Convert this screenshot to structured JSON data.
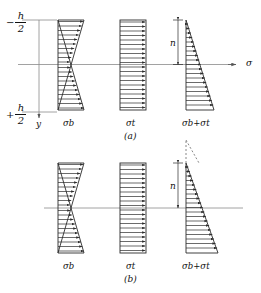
{
  "figure": {
    "title_caption_a": "(a)",
    "title_caption_b": "(b)",
    "axis": {
      "sigma_label": "σ",
      "y_label": "y",
      "top_ordinate_sign": "−",
      "top_ordinate_num": "h",
      "top_ordinate_den": "2",
      "bottom_ordinate_sign": "+",
      "bottom_ordinate_num": "h",
      "bottom_ordinate_den": "2"
    },
    "dimension": {
      "n_label": "n"
    },
    "panels": [
      {
        "id": "a",
        "caption": "(a)",
        "distributions": [
          {
            "name": "bending",
            "label_main": "σ",
            "label_sub": "b",
            "type": "antisymmetric-linear"
          },
          {
            "name": "axial",
            "label_main": "σ",
            "label_sub": "t",
            "type": "uniform"
          },
          {
            "name": "combined",
            "label_main": "σ",
            "label_sub": "b",
            "label_plus": "+",
            "label_main2": "σ",
            "label_sub2": "t",
            "type": "triangular"
          }
        ]
      },
      {
        "id": "b",
        "caption": "(b)",
        "distributions": [
          {
            "name": "bending",
            "label_main": "σ",
            "label_sub": "b",
            "type": "antisymmetric-linear"
          },
          {
            "name": "axial",
            "label_main": "σ",
            "label_sub": "t",
            "type": "uniform"
          },
          {
            "name": "combined",
            "label_main": "σ",
            "label_sub": "b",
            "label_plus": "+",
            "label_main2": "σ",
            "label_sub2": "t",
            "type": "triangular-dashed-apex"
          }
        ]
      }
    ],
    "labels": {
      "sigma_b": "σb",
      "sigma_t": "σt",
      "sigma_sum": "σb+σt"
    },
    "colors": {
      "ink": "#1a1a1a",
      "axis": "#8a8a8a",
      "hatch": "#2b2b2b"
    }
  }
}
